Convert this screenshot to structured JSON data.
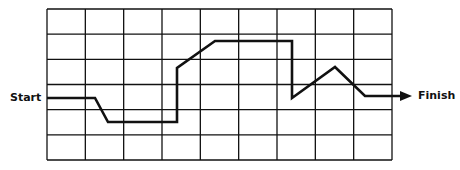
{
  "diagram": {
    "type": "grid-path",
    "start_label": "Start",
    "finish_label": "Finish",
    "grid": {
      "columns": 9,
      "rows": 6,
      "x": 47,
      "y": 9,
      "width": 345,
      "height": 151
    },
    "path_points": [
      [
        47,
        98
      ],
      [
        95,
        98
      ],
      [
        108,
        122
      ],
      [
        177,
        122
      ],
      [
        177,
        68
      ],
      [
        215,
        41
      ],
      [
        292,
        41
      ],
      [
        292,
        98
      ],
      [
        335,
        67
      ],
      [
        365,
        96
      ],
      [
        402,
        96
      ]
    ],
    "arrow_tip": [
      412,
      96
    ],
    "colors": {
      "line": "#111111",
      "background": "#ffffff"
    }
  }
}
